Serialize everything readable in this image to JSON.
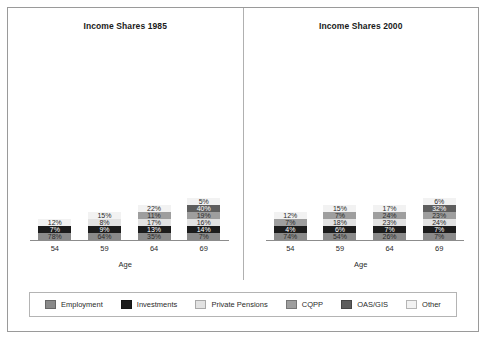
{
  "chart_data": {
    "type": "bar",
    "subtype": "stacked-percent",
    "xlabel": "Age",
    "ylabel": "",
    "ylim": [
      0,
      100
    ],
    "grid": false,
    "legend_position": "bottom",
    "categories": [
      "54",
      "59",
      "64",
      "69"
    ],
    "series_order": [
      "Employment",
      "Investments",
      "Private Pensions",
      "CQPP",
      "OAS/GIS",
      "Other"
    ],
    "colors": {
      "Employment": "#8a8a8a",
      "Investments": "#1c1c1c",
      "Private Pensions": "#e2e2e2",
      "CQPP": "#9e9e9e",
      "OAS/GIS": "#5e5e5e",
      "Other": "#f2f2f2"
    },
    "panels": [
      {
        "title": "Income Shares 1985",
        "bars": [
          {
            "category": "54",
            "segments": [
              {
                "name": "Employment",
                "value": 78,
                "label": "78%",
                "show": true
              },
              {
                "name": "Investments",
                "value": 7,
                "label": "7%",
                "show": true
              },
              {
                "name": "Private Pensions",
                "value": 1,
                "label": "",
                "show": false
              },
              {
                "name": "CQPP",
                "value": 2,
                "label": "",
                "show": false
              },
              {
                "name": "OAS/GIS",
                "value": 0,
                "label": "",
                "show": false
              },
              {
                "name": "Other",
                "value": 12,
                "label": "12%",
                "show": true
              }
            ]
          },
          {
            "category": "59",
            "segments": [
              {
                "name": "Employment",
                "value": 64,
                "label": "64%",
                "show": true
              },
              {
                "name": "Investments",
                "value": 9,
                "label": "9%",
                "show": true
              },
              {
                "name": "Private Pensions",
                "value": 8,
                "label": "8%",
                "show": true
              },
              {
                "name": "CQPP",
                "value": 4,
                "label": "",
                "show": false
              },
              {
                "name": "OAS/GIS",
                "value": 0,
                "label": "",
                "show": false
              },
              {
                "name": "Other",
                "value": 15,
                "label": "15%",
                "show": true
              }
            ]
          },
          {
            "category": "64",
            "segments": [
              {
                "name": "Employment",
                "value": 35,
                "label": "35%",
                "show": true
              },
              {
                "name": "Investments",
                "value": 13,
                "label": "13%",
                "show": true
              },
              {
                "name": "Private Pensions",
                "value": 17,
                "label": "17%",
                "show": true
              },
              {
                "name": "CQPP",
                "value": 11,
                "label": "11%",
                "show": true
              },
              {
                "name": "OAS/GIS",
                "value": 2,
                "label": "",
                "show": false
              },
              {
                "name": "Other",
                "value": 22,
                "label": "22%",
                "show": true
              }
            ]
          },
          {
            "category": "69",
            "segments": [
              {
                "name": "Employment",
                "value": 7,
                "label": "7%",
                "show": true
              },
              {
                "name": "Investments",
                "value": 14,
                "label": "14%",
                "show": true
              },
              {
                "name": "Private Pensions",
                "value": 16,
                "label": "16%",
                "show": true
              },
              {
                "name": "CQPP",
                "value": 19,
                "label": "19%",
                "show": true
              },
              {
                "name": "OAS/GIS",
                "value": 40,
                "label": "40%",
                "show": true
              },
              {
                "name": "Other",
                "value": 5,
                "label": "5%",
                "show": true
              }
            ]
          }
        ]
      },
      {
        "title": "Income Shares 2000",
        "bars": [
          {
            "category": "54",
            "segments": [
              {
                "name": "Employment",
                "value": 74,
                "label": "74%",
                "show": true
              },
              {
                "name": "Investments",
                "value": 4,
                "label": "4%",
                "show": true
              },
              {
                "name": "Private Pensions",
                "value": 1,
                "label": "",
                "show": false
              },
              {
                "name": "CQPP",
                "value": 7,
                "label": "7%",
                "show": true
              },
              {
                "name": "OAS/GIS",
                "value": 2,
                "label": "",
                "show": false
              },
              {
                "name": "Other",
                "value": 12,
                "label": "12%",
                "show": true
              }
            ]
          },
          {
            "category": "59",
            "segments": [
              {
                "name": "Employment",
                "value": 54,
                "label": "54%",
                "show": true
              },
              {
                "name": "Investments",
                "value": 6,
                "label": "6%",
                "show": true
              },
              {
                "name": "Private Pensions",
                "value": 18,
                "label": "18%",
                "show": true
              },
              {
                "name": "CQPP",
                "value": 7,
                "label": "7%",
                "show": true
              },
              {
                "name": "OAS/GIS",
                "value": 0,
                "label": "",
                "show": false
              },
              {
                "name": "Other",
                "value": 15,
                "label": "15%",
                "show": true
              }
            ]
          },
          {
            "category": "64",
            "segments": [
              {
                "name": "Employment",
                "value": 26,
                "label": "26%",
                "show": true
              },
              {
                "name": "Investments",
                "value": 7,
                "label": "7%",
                "show": true
              },
              {
                "name": "Private Pensions",
                "value": 23,
                "label": "23%",
                "show": true
              },
              {
                "name": "CQPP",
                "value": 24,
                "label": "24%",
                "show": true
              },
              {
                "name": "OAS/GIS",
                "value": 3,
                "label": "",
                "show": false
              },
              {
                "name": "Other",
                "value": 17,
                "label": "17%",
                "show": true
              }
            ]
          },
          {
            "category": "69",
            "segments": [
              {
                "name": "Employment",
                "value": 7,
                "label": "7%",
                "show": true
              },
              {
                "name": "Investments",
                "value": 7,
                "label": "7%",
                "show": true
              },
              {
                "name": "Private Pensions",
                "value": 24,
                "label": "24%",
                "show": true
              },
              {
                "name": "CQPP",
                "value": 23,
                "label": "23%",
                "show": true
              },
              {
                "name": "OAS/GIS",
                "value": 32,
                "label": "32%",
                "show": true
              },
              {
                "name": "Other",
                "value": 6,
                "label": "6%",
                "show": true
              }
            ]
          }
        ]
      }
    ],
    "legend": [
      {
        "label": "Employment",
        "color": "#8a8a8a"
      },
      {
        "label": "Investments",
        "color": "#1c1c1c"
      },
      {
        "label": "Private Pensions",
        "color": "#e2e2e2"
      },
      {
        "label": "CQPP",
        "color": "#9e9e9e"
      },
      {
        "label": "OAS/GIS",
        "color": "#5e5e5e"
      },
      {
        "label": "Other",
        "color": "#f2f2f2"
      }
    ]
  }
}
